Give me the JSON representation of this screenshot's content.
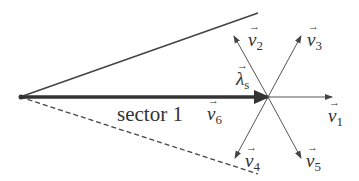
{
  "diagram": {
    "type": "space-vector sector diagram",
    "sector_label": "sector 1",
    "flux_vector": {
      "symbol": "λ",
      "subscript": "s"
    },
    "voltage_vectors": [
      {
        "id": "v1",
        "symbol": "v",
        "subscript": "1",
        "direction": "0°"
      },
      {
        "id": "v2",
        "symbol": "v",
        "subscript": "2",
        "direction": "120°"
      },
      {
        "id": "v3",
        "symbol": "v",
        "subscript": "3",
        "direction": "60°"
      },
      {
        "id": "v4",
        "symbol": "v",
        "subscript": "4",
        "direction": "240°"
      },
      {
        "id": "v5",
        "symbol": "v",
        "subscript": "5",
        "direction": "300°"
      },
      {
        "id": "v6",
        "symbol": "v",
        "subscript": "6",
        "direction": "180°"
      }
    ],
    "colors": {
      "line": "#444444",
      "text": "#333333",
      "background": "#ffffff"
    }
  }
}
